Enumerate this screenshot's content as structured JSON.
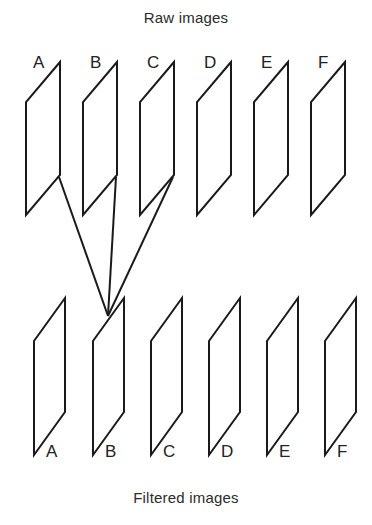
{
  "figure": {
    "top_caption": "Raw images",
    "bottom_caption": "Filtered images",
    "line_color": "#1a1a1a",
    "text_color": "#2b2b2b",
    "background_color": "#ffffff"
  },
  "top_row": {
    "caption": "Raw images",
    "panels": [
      {
        "label": "A",
        "label_x": 33,
        "label_y": 54,
        "tr_x": 60,
        "tr_y": 62
      },
      {
        "label": "B",
        "label_x": 90,
        "label_y": 54,
        "tr_x": 117,
        "tr_y": 62
      },
      {
        "label": "C",
        "label_x": 147,
        "label_y": 54,
        "tr_x": 174,
        "tr_y": 62
      },
      {
        "label": "D",
        "label_x": 204,
        "label_y": 54,
        "tr_x": 231,
        "tr_y": 62
      },
      {
        "label": "E",
        "label_x": 261,
        "label_y": 54,
        "tr_x": 288,
        "tr_y": 62
      },
      {
        "label": "F",
        "label_x": 318,
        "label_y": 54,
        "tr_x": 345,
        "tr_y": 62
      }
    ],
    "shape": {
      "width": 34,
      "height": 113,
      "skew": 40,
      "note": "parallelogram: top-right vertex, left side offset down-left"
    }
  },
  "bottom_row": {
    "caption": "Filtered images",
    "panels": [
      {
        "label": "A",
        "label_x": 46,
        "label_y": 443,
        "tr_x": 65,
        "tr_y": 298
      },
      {
        "label": "B",
        "label_x": 105,
        "label_y": 443,
        "tr_x": 124,
        "tr_y": 298
      },
      {
        "label": "C",
        "label_x": 163,
        "label_y": 443,
        "tr_x": 182,
        "tr_y": 298
      },
      {
        "label": "D",
        "label_x": 221,
        "label_y": 443,
        "tr_x": 240,
        "tr_y": 298
      },
      {
        "label": "E",
        "label_x": 279,
        "label_y": 443,
        "tr_x": 298,
        "tr_y": 298
      },
      {
        "label": "F",
        "label_x": 337,
        "label_y": 443,
        "tr_x": 356,
        "tr_y": 298
      }
    ],
    "shape": {
      "width": 31,
      "height": 114,
      "skew": 43,
      "note": "parallelogram: top-right vertex, left side offset down-left"
    }
  },
  "connectors": {
    "converge_point": {
      "x": 108,
      "y": 316
    },
    "sources": [
      {
        "from_panel": "A",
        "x": 59,
        "y": 177
      },
      {
        "from_panel": "B",
        "x": 116,
        "y": 177
      },
      {
        "from_panel": "C",
        "x": 173,
        "y": 177
      }
    ],
    "target_panel": "B",
    "description": "three lines from raw images A, B, C converge at filtered image B"
  }
}
